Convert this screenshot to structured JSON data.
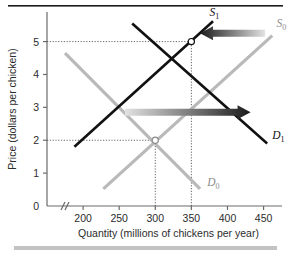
{
  "figure": {
    "background": "#ffffff",
    "top_rule_color": "#1b1b1b",
    "bottom_bar_color": "#c3c3c3"
  },
  "chart_data": {
    "type": "line",
    "title": "",
    "xlabel": "Quantity (millions of chickens per year)",
    "ylabel": "Price (dollars per chicken)",
    "xlim": [
      150,
      470
    ],
    "ylim": [
      0,
      5.9
    ],
    "x_ticks": [
      200,
      250,
      300,
      350,
      400,
      450
    ],
    "x_tick_labels": [
      "200",
      "250",
      "300",
      "350",
      "400",
      "450"
    ],
    "x_origin_label": "0",
    "y_ticks": [
      1,
      2,
      3,
      4,
      5
    ],
    "y_tick_labels": [
      "1",
      "2",
      "3",
      "4",
      "5"
    ],
    "axis_break": true,
    "grid": false,
    "series": [
      {
        "name": "D0",
        "label": "D",
        "subscript": "0",
        "role": "demand-original",
        "color": "#b9b9b9",
        "points": [
          [
            175,
            4.65
          ],
          [
            362,
            0.52
          ]
        ],
        "label_pos": [
          372,
          0.62
        ]
      },
      {
        "name": "D1",
        "label": "D",
        "subscript": "1",
        "role": "demand-new",
        "color": "#111111",
        "points": [
          [
            268,
            5.55
          ],
          [
            455,
            1.9
          ]
        ],
        "label_pos": [
          462,
          2.05
        ]
      },
      {
        "name": "S0",
        "label": "S",
        "subscript": "0",
        "role": "supply-original",
        "color": "#b9b9b9",
        "points": [
          [
            228,
            0.52
          ],
          [
            462,
            5.18
          ]
        ],
        "label_pos": [
          468,
          5.45
        ]
      },
      {
        "name": "S1",
        "label": "S",
        "subscript": "1",
        "role": "supply-new",
        "color": "#111111",
        "points": [
          [
            188,
            1.8
          ],
          [
            380,
            5.62
          ]
        ],
        "label_pos": [
          375,
          5.78
        ]
      }
    ],
    "equilibria": [
      {
        "name": "equilibrium-original",
        "x": 300,
        "y": 2,
        "style": "gray"
      },
      {
        "name": "equilibrium-new",
        "x": 350,
        "y": 5,
        "style": "dark"
      }
    ],
    "guide_lines": [
      {
        "name": "price-5-guide",
        "from": [
          150,
          5
        ],
        "to": [
          350,
          5
        ]
      },
      {
        "name": "quantity-350-guide",
        "from": [
          350,
          0
        ],
        "to": [
          350,
          5
        ]
      },
      {
        "name": "price-2-guide",
        "from": [
          150,
          2
        ],
        "to": [
          300,
          2
        ]
      },
      {
        "name": "quantity-300-guide",
        "from": [
          300,
          0
        ],
        "to": [
          300,
          2
        ]
      }
    ],
    "annotations": [
      {
        "name": "supply-shift-arrow",
        "direction": "left",
        "from": [
          452,
          5.25
        ],
        "to": [
          362,
          5.25
        ],
        "gradient": [
          "#e2e2e2",
          "#1b1b1b"
        ],
        "meaning": "supply decreases"
      },
      {
        "name": "demand-shift-arrow",
        "direction": "right",
        "from": [
          258,
          2.85
        ],
        "to": [
          432,
          2.85
        ],
        "gradient": [
          "#e2e2e2",
          "#1b1b1b"
        ],
        "meaning": "demand increases"
      }
    ]
  }
}
